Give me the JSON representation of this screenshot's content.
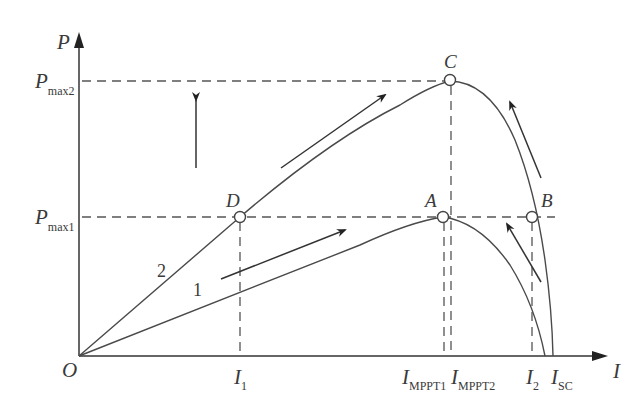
{
  "figure": {
    "type": "P-I characteristic curves (MPPT)",
    "axes": {
      "y_label": "P",
      "x_label": "I",
      "origin_label": "O"
    },
    "y_ticks": [
      {
        "main": "P",
        "sub": "max2"
      },
      {
        "main": "P",
        "sub": "max1"
      }
    ],
    "x_ticks": [
      {
        "main": "I",
        "sub": "1"
      },
      {
        "main": "I",
        "sub": "MPPT1"
      },
      {
        "main": "I",
        "sub": "MPPT2"
      },
      {
        "main": "I",
        "sub": "2"
      },
      {
        "main": "I",
        "sub": "SC"
      }
    ],
    "points": [
      {
        "name": "A",
        "label": "A"
      },
      {
        "name": "B",
        "label": "B"
      },
      {
        "name": "C",
        "label": "C"
      },
      {
        "name": "D",
        "label": "D"
      }
    ],
    "curves": [
      {
        "id": "1",
        "label": "1"
      },
      {
        "id": "2",
        "label": "2"
      }
    ],
    "colors": {
      "line": "#4a4a4a",
      "dash": "#555555",
      "background": "#ffffff"
    }
  }
}
